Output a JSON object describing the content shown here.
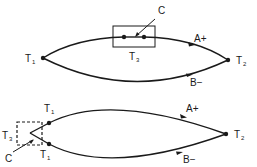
{
  "figure": {
    "top": {
      "labels": {
        "t1": "T",
        "t1_sub": "1",
        "t2": "T",
        "t2_sub": "2",
        "t3": "T",
        "t3_sub": "3",
        "c": "C",
        "a": "A+",
        "b": "B−"
      },
      "junction_box_style": "solid"
    },
    "bottom": {
      "labels": {
        "t1_upper": "T",
        "t1_upper_sub": "1",
        "t1_lower": "T",
        "t1_lower_sub": "1",
        "t2": "T",
        "t2_sub": "2",
        "t3": "T",
        "t3_sub": "3",
        "c": "C",
        "a": "A+",
        "b": "B−"
      },
      "junction_box_style": "dashed"
    },
    "colors": {
      "ink": "#1a1a1a",
      "background": "#ffffff"
    }
  }
}
